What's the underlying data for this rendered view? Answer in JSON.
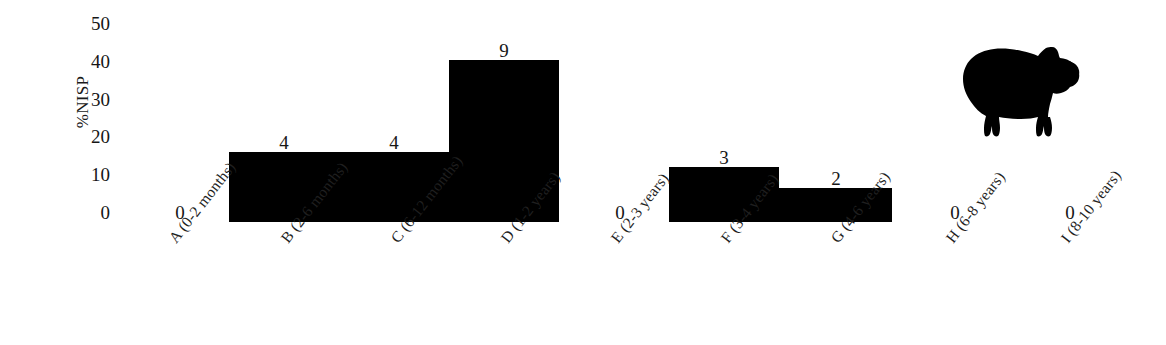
{
  "chart_data": {
    "type": "bar",
    "title": "",
    "xlabel": "",
    "ylabel": "%NISP",
    "ylim": [
      0,
      50
    ],
    "yticks": [
      0,
      10,
      20,
      30,
      40,
      50
    ],
    "grid": false,
    "legend": null,
    "categories": [
      "A (0-2 months)",
      "B (2-6 months)",
      "C (6-12 months)",
      "D (1-2 years)",
      "E (2-3 years)",
      "F (3-4 years)",
      "G (4-6 years)",
      "H (6-8 years)",
      "I (8-10 years)"
    ],
    "values": [
      0,
      18.5,
      18.5,
      42.8,
      0,
      14.5,
      9.0,
      0,
      0
    ],
    "point_labels": [
      "0",
      "4",
      "4",
      "9",
      "0",
      "3",
      "2",
      "0",
      "0"
    ],
    "bar_color": "#000000",
    "annotations": [
      "sheep-silhouette"
    ]
  },
  "axis": {
    "y_title": "%NISP",
    "y_ticks": [
      {
        "label": "50",
        "top": 14
      },
      {
        "label": "40",
        "top": 52
      },
      {
        "label": "30",
        "top": 90
      },
      {
        "label": "20",
        "top": 127
      },
      {
        "label": "10",
        "top": 165
      },
      {
        "label": "0",
        "top": 203
      }
    ]
  },
  "bars": [
    {
      "key": "A",
      "label": "A (0-2 months)",
      "value_label": "0",
      "left": 150,
      "width": 80,
      "height": 0,
      "label_x": 150,
      "label_y": 203,
      "tick_x": 166
    },
    {
      "key": "B",
      "label": "B (2-6 months)",
      "value_label": "4",
      "left": 229,
      "width": 110,
      "height": 70,
      "label_x": 254,
      "label_y": 133,
      "tick_x": 278
    },
    {
      "key": "C",
      "label": "C (6-12 months)",
      "value_label": "4",
      "left": 339,
      "width": 110,
      "height": 70,
      "label_x": 364,
      "label_y": 133,
      "tick_x": 388
    },
    {
      "key": "D",
      "label": "D (1-2 years)",
      "value_label": "9",
      "left": 449,
      "width": 110,
      "height": 162,
      "label_x": 474,
      "label_y": 41,
      "tick_x": 498
    },
    {
      "key": "E",
      "label": "E (2-3 years)",
      "value_label": "0",
      "left": 559,
      "width": 110,
      "height": 0,
      "label_x": 590,
      "label_y": 203,
      "tick_x": 608
    },
    {
      "key": "F",
      "label": "F (3-4 years)",
      "value_label": "3",
      "left": 669,
      "width": 110,
      "height": 55,
      "label_x": 694,
      "label_y": 148,
      "tick_x": 718
    },
    {
      "key": "G",
      "label": "G (4-6 years)",
      "value_label": "2",
      "left": 779,
      "width": 113,
      "height": 34,
      "label_x": 806,
      "label_y": 169,
      "tick_x": 828
    },
    {
      "key": "H",
      "label": "H (6-8 years)",
      "value_label": "0",
      "left": 892,
      "width": 110,
      "height": 0,
      "label_x": 925,
      "label_y": 203,
      "tick_x": 943
    },
    {
      "key": "I",
      "label": "I (8-10 years)",
      "value_label": "0",
      "left": 1002,
      "width": 110,
      "height": 0,
      "label_x": 1040,
      "label_y": 203,
      "tick_x": 1058
    }
  ],
  "figure": {
    "animal_icon": "sheep-silhouette"
  }
}
